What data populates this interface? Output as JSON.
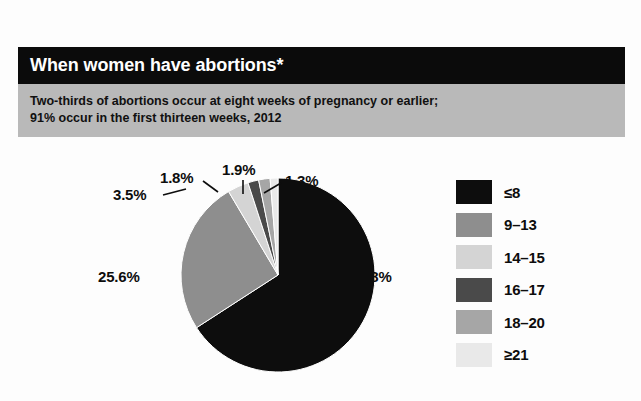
{
  "header": {
    "title": "When women have abortions*",
    "subtitle_line1": "Two-thirds of abortions occur at eight weeks of pregnancy or earlier;",
    "subtitle_line2": "91% occur in the first thirteen weeks, 2012",
    "bar_color": "#0b0b0b",
    "subhead_color": "#b9b9b9"
  },
  "chart_data": {
    "type": "pie",
    "title": "When women have abortions*",
    "subtitle": "Two-thirds of abortions occur at eight weeks of pregnancy or earlier; 91% occur in the first thirteen weeks, 2012",
    "xlabel": "",
    "ylabel": "",
    "legend_position": "right",
    "grid": false,
    "unit": "%",
    "categories": [
      "≤8",
      "9–13",
      "14–15",
      "16–17",
      "18–20",
      "≥21"
    ],
    "values": [
      65.8,
      25.6,
      3.5,
      1.8,
      1.9,
      1.3
    ],
    "value_labels": [
      "65.8%",
      "25.6%",
      "3.5%",
      "1.8%",
      "1.9%",
      "1.3%"
    ],
    "colors": [
      "#0d0d0d",
      "#8e8e8e",
      "#d4d4d4",
      "#4a4a4a",
      "#a6a6a6",
      "#e9e9e9"
    ],
    "start_angle_deg": 0,
    "direction": "clockwise"
  },
  "legend": {
    "items": [
      {
        "label": "≤8",
        "color": "#0d0d0d"
      },
      {
        "label": "9–13",
        "color": "#8e8e8e"
      },
      {
        "label": "14–15",
        "color": "#d4d4d4"
      },
      {
        "label": "16–17",
        "color": "#4a4a4a"
      },
      {
        "label": "18–20",
        "color": "#a6a6a6"
      },
      {
        "label": "≥21",
        "color": "#e9e9e9"
      }
    ]
  }
}
